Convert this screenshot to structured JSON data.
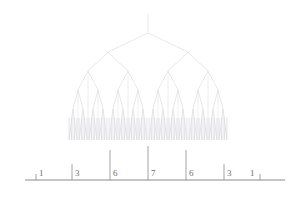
{
  "figure": {
    "kind": "nmr-splitting-tree",
    "title": "",
    "background": "#ffffff",
    "tree_color": "#e2e2e6",
    "peak_color": "#d9d9de",
    "axis_color": "#8a8a8a",
    "tick_color": "#9a9a9e",
    "label_color": "#6e6e6e"
  },
  "chart_data": {
    "type": "line",
    "title": "",
    "subtitle": "",
    "xlabel": "",
    "ylabel": "",
    "grid": false,
    "legend": null,
    "categories": [
      "1",
      "3",
      "6",
      "7",
      "6",
      "3",
      "1"
    ],
    "values": [
      1,
      3,
      6,
      7,
      6,
      3,
      1
    ],
    "tick_labels": [
      "1",
      "3",
      "6",
      "7",
      "6",
      "3",
      "1"
    ],
    "tick_x": [
      36,
      72,
      110,
      148,
      186,
      224,
      260
    ],
    "tick_heights": [
      6,
      16,
      30,
      34,
      30,
      16,
      6
    ],
    "axis": {
      "x_start": 25,
      "x_end": 285,
      "y": 180,
      "ylim": [
        0,
        7
      ],
      "xlim": [
        25,
        285
      ]
    },
    "tree": {
      "root_x": 148,
      "root_top_y": 14,
      "levels": 6,
      "level_y": [
        33,
        52,
        71,
        90,
        109,
        128
      ],
      "splittings_px": [
        40,
        20,
        10,
        5,
        2.6,
        1.3
      ],
      "peak_baseline_y": 140
    }
  },
  "ticks": [
    {
      "label": "1",
      "x": 36,
      "height": 6,
      "label_x": 39,
      "label_y": 169
    },
    {
      "label": "3",
      "x": 72,
      "height": 16,
      "label_x": 75,
      "label_y": 169
    },
    {
      "label": "6",
      "x": 110,
      "height": 30,
      "label_x": 113,
      "label_y": 169
    },
    {
      "label": "7",
      "x": 148,
      "height": 34,
      "label_x": 151,
      "label_y": 169
    },
    {
      "label": "6",
      "x": 186,
      "height": 30,
      "label_x": 189,
      "label_y": 169
    },
    {
      "label": "3",
      "x": 224,
      "height": 16,
      "label_x": 227,
      "label_y": 169
    },
    {
      "label": "1",
      "x": 260,
      "height": 6,
      "label_x": 250,
      "label_y": 169
    }
  ]
}
